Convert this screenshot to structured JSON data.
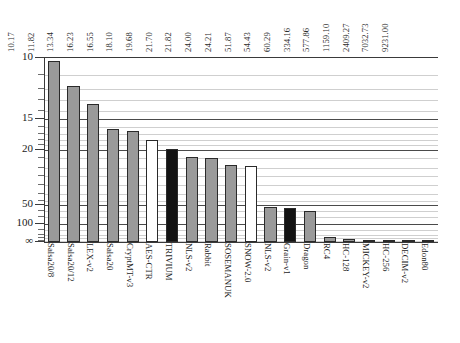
{
  "chart_data": {
    "type": "bar",
    "title": "",
    "xlabel": "",
    "ylabel": "",
    "axis_inverted": true,
    "axis_scale": "log-reciprocal",
    "grid": true,
    "legend_position": "none",
    "ylim": [
      10,
      "∞"
    ],
    "ytick_labels": [
      "10",
      "15",
      "20",
      "50",
      "100",
      "∞"
    ],
    "ytick_values": [
      10,
      15,
      20,
      50,
      100,
      0
    ],
    "categories": [
      "Salsa20/8",
      "Salsa20/12",
      "LEX-v2",
      "Salsa20",
      "CryptMT-v3",
      "AES-CTR",
      "TRIVIUM",
      "NLS-v2",
      "Rabbit",
      "SOSEMANUK",
      "SNOW-2.0",
      "NLS-v2",
      "Grain-v1",
      "Dragon",
      "RC4",
      "HC-128",
      "MICKEY-v2",
      "HC-256",
      "DECIM-v2",
      "Edon80"
    ],
    "values": [
      10.17,
      11.82,
      13.34,
      16.23,
      16.55,
      18.1,
      19.68,
      21.7,
      21.82,
      24.0,
      24.21,
      51.87,
      54.43,
      60.29,
      334.16,
      577.86,
      1159.1,
      2409.27,
      7032.73,
      9231.0
    ],
    "value_labels": [
      "10.17",
      "11.82",
      "13.34",
      "16.23",
      "16.55",
      "18.10",
      "19.68",
      "21.70",
      "21.82",
      "24.00",
      "24.21",
      "51.87",
      "54.43",
      "60.29",
      "334.16",
      "577.86",
      "1159.10",
      "2409.27",
      "7032.73",
      "9231.00"
    ],
    "bar_colors": [
      "gray",
      "gray",
      "gray",
      "gray",
      "gray",
      "white",
      "black",
      "gray",
      "gray",
      "gray",
      "white",
      "gray",
      "black",
      "gray",
      "gray",
      "gray",
      "gray",
      "gray",
      "gray",
      "gray"
    ],
    "color_hex": {
      "gray": "#9a9a9a",
      "black": "#131313",
      "white": "#ffffff",
      "grid_major": "#4a4a4a",
      "grid_minor": "#cfcfcf",
      "axis": "#3a3a3a"
    }
  },
  "caption": {
    "text": ""
  }
}
